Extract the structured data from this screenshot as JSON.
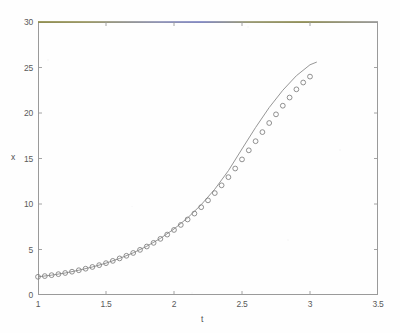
{
  "chart_data": {
    "type": "line",
    "title": "",
    "xlabel": "t",
    "ylabel": "x",
    "xlim": [
      1,
      3.5
    ],
    "ylim": [
      0,
      30
    ],
    "grid": false,
    "legend": null,
    "xticks": [
      "1",
      "1.5",
      "2",
      "2.5",
      "3",
      "3.5"
    ],
    "xtick_values": [
      1,
      1.5,
      2,
      2.5,
      3,
      3.5
    ],
    "yticks": [
      "0",
      "5",
      "10",
      "15",
      "20",
      "25",
      "30"
    ],
    "ytick_values": [
      0,
      5,
      10,
      15,
      20,
      25,
      30
    ],
    "series": [
      {
        "name": "analytic-solution",
        "style": "solid-line",
        "color": "#8a8a8a",
        "x": [
          1,
          1.1,
          1.2,
          1.3,
          1.4,
          1.5,
          1.6,
          1.7,
          1.8,
          1.9,
          2,
          2.1,
          2.2,
          2.3,
          2.4,
          2.5,
          2.6,
          2.7,
          2.8,
          2.9,
          3,
          3.05
        ],
        "values": [
          2,
          2.18,
          2.42,
          2.72,
          3.08,
          3.5,
          4.02,
          4.63,
          5.36,
          6.22,
          7.25,
          8.47,
          9.92,
          11.63,
          13.66,
          16.05,
          18.41,
          20.6,
          22.5,
          24.1,
          25.3,
          25.6
        ]
      },
      {
        "name": "numerical-solution",
        "style": "open-circle-markers",
        "color": "#7d7d7d",
        "x": [
          1,
          1.05,
          1.1,
          1.15,
          1.2,
          1.25,
          1.3,
          1.35,
          1.4,
          1.45,
          1.5,
          1.55,
          1.6,
          1.65,
          1.7,
          1.75,
          1.8,
          1.85,
          1.9,
          1.95,
          2,
          2.05,
          2.1,
          2.15,
          2.2,
          2.25,
          2.3,
          2.35,
          2.4,
          2.45,
          2.5,
          2.55,
          2.6,
          2.65,
          2.7,
          2.75,
          2.8,
          2.85,
          2.9,
          2.95,
          3
        ],
        "values": [
          2,
          2.08,
          2.18,
          2.29,
          2.42,
          2.56,
          2.72,
          2.89,
          3.08,
          3.28,
          3.5,
          3.75,
          4.02,
          4.31,
          4.62,
          4.96,
          5.33,
          5.73,
          6.17,
          6.64,
          7.15,
          7.7,
          8.3,
          8.95,
          9.65,
          10.4,
          11.2,
          12.05,
          12.95,
          13.9,
          14.9,
          15.9,
          16.9,
          17.9,
          18.9,
          19.85,
          20.8,
          21.7,
          22.6,
          23.35,
          24
        ]
      }
    ]
  }
}
